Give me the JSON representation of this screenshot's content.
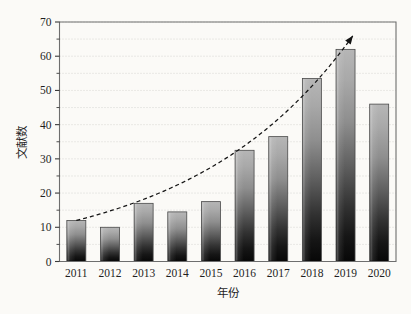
{
  "chart_data": {
    "type": "bar",
    "title": "",
    "subtitle": "",
    "xlabel": "年份",
    "ylabel": "文献数",
    "categories": [
      "2011",
      "2012",
      "2013",
      "2014",
      "2015",
      "2016",
      "2017",
      "2018",
      "2019",
      "2020"
    ],
    "values": [
      12,
      10,
      17,
      14.5,
      17.5,
      32.5,
      36.5,
      53.5,
      62,
      46
    ],
    "series": [
      {
        "name": "文献数",
        "values": [
          12,
          10,
          17,
          14.5,
          17.5,
          32.5,
          36.5,
          53.5,
          62,
          46
        ]
      }
    ],
    "ylim": [
      0,
      70
    ],
    "y_ticks": [
      0,
      10,
      20,
      30,
      40,
      50,
      60,
      70
    ],
    "y_tick_labels": [
      "0",
      "10",
      "20",
      "30",
      "40",
      "50",
      "60",
      "70"
    ],
    "y_minor_ticks": [
      5,
      15,
      25,
      35,
      45,
      55,
      65
    ],
    "x_tick_labels": [
      "2011",
      "2012",
      "2013",
      "2014",
      "2015",
      "2016",
      "2017",
      "2018",
      "2019",
      "2020"
    ],
    "grid": "horizontal-dotted-minor",
    "legend": "none",
    "legend_position": "none",
    "annotations": [
      {
        "name": "exponential-trend-arrow",
        "kind": "dashed-curve-with-arrowhead",
        "description": "dashed exponential trend curve rising from 2011 to beyond 2019",
        "start_category": "2011",
        "start_value": 12,
        "end_value": 66
      }
    ],
    "colors": {
      "bar_top": "#b4b4b4",
      "bar_bottom": "#0d0d0d",
      "bar_edge": "#4a4a4a",
      "trend": "#141414",
      "grid": "#c9c9c4",
      "frame": "#6e6e6e",
      "background": "#fbfaf7",
      "text": "#1f1f1f"
    }
  }
}
